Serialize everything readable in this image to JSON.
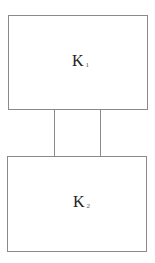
{
  "diagram": {
    "nodes": [
      {
        "id": "K1",
        "label": "K",
        "subscript": "1"
      },
      {
        "id": "K2",
        "label": "K",
        "subscript": "2"
      }
    ],
    "edges": [
      {
        "from": "K1",
        "to": "K2"
      },
      {
        "from": "K1",
        "to": "K2"
      }
    ],
    "colors": {
      "stroke": "#8a8a8a",
      "text": "#222222",
      "background": "#ffffff"
    }
  }
}
